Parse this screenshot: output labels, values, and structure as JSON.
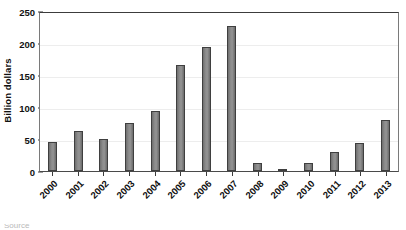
{
  "chart_data": {
    "type": "bar",
    "title": "",
    "subtitle": "",
    "xlabel": "",
    "ylabel": "Billion dollars",
    "ylim": [
      0,
      250
    ],
    "yticks": [
      0,
      50,
      100,
      150,
      200,
      250
    ],
    "grid": true,
    "legend": null,
    "bar_color": "#8a8a8a",
    "bar_edge_color": "#3f3f3f",
    "categories": [
      "2000",
      "2001",
      "2002",
      "2003",
      "2004",
      "2005",
      "2006",
      "2007",
      "2008",
      "2009",
      "2010",
      "2011",
      "2012",
      "2013"
    ],
    "values": [
      45,
      63,
      50,
      75,
      93,
      165,
      193,
      227,
      12,
      3,
      13,
      30,
      44,
      79
    ],
    "xtick_rotation": -45,
    "annotations": []
  },
  "caption": {
    "cropped_text": "Source"
  }
}
